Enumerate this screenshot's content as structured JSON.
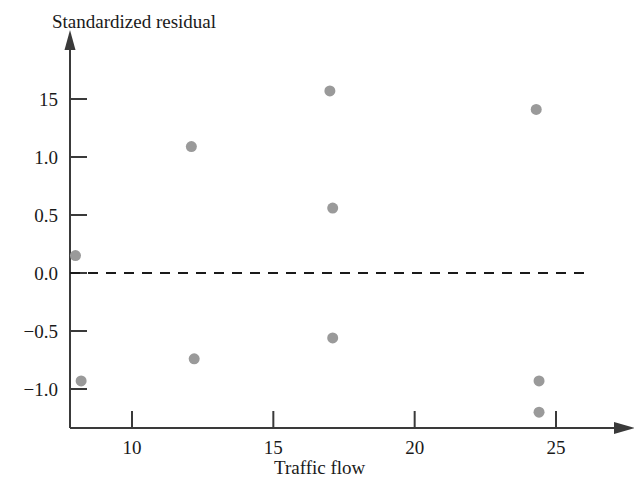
{
  "chart_data": {
    "type": "scatter",
    "title": "",
    "xlabel": "Traffic flow",
    "ylabel": "Standardized residual",
    "xlim": [
      6.0,
      26.8
    ],
    "ylim": [
      -1.45,
      1.78
    ],
    "grid": false,
    "legend": null,
    "reference_line": {
      "orientation": "horizontal",
      "value": 0.0,
      "style": "dashed",
      "color": "#1a1a1a",
      "x_start": 6.0,
      "x_end": 26.0
    },
    "xticks": [
      10,
      15,
      20,
      25
    ],
    "xtick_labels": [
      "10",
      "15",
      "20",
      "25"
    ],
    "yticks": [
      1.5,
      1.0,
      0.5,
      0.0,
      -0.5,
      -1.0
    ],
    "ytick_labels": [
      "15",
      "1.0",
      "0.5",
      "0.0",
      "−0.5",
      "−1.0"
    ],
    "marker": {
      "shape": "circle",
      "color": "#9a9a9a",
      "size": 11
    },
    "points": [
      {
        "x": 8.0,
        "y": 0.15
      },
      {
        "x": 8.2,
        "y": -0.93
      },
      {
        "x": 12.1,
        "y": 1.09
      },
      {
        "x": 12.2,
        "y": -0.74
      },
      {
        "x": 17.0,
        "y": 1.57
      },
      {
        "x": 17.1,
        "y": 0.56
      },
      {
        "x": 17.1,
        "y": -0.56
      },
      {
        "x": 24.3,
        "y": 1.41
      },
      {
        "x": 24.4,
        "y": -0.93
      },
      {
        "x": 24.4,
        "y": -1.2
      }
    ],
    "axis_style": {
      "color": "#3a3a3a",
      "arrow_x": true,
      "arrow_y": true
    }
  }
}
